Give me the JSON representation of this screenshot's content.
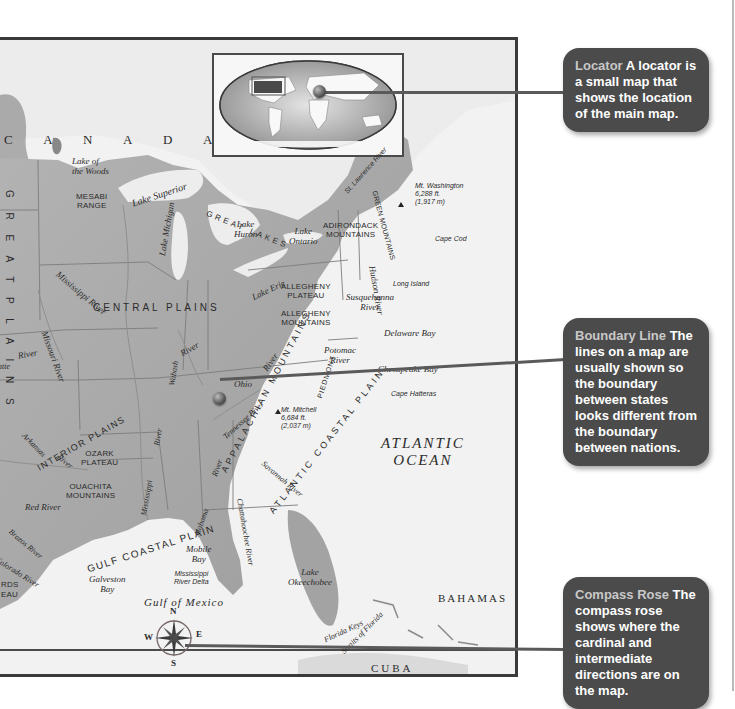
{
  "map": {
    "countries": {
      "canada": "C A N A D A",
      "bahamas": "BAHAMAS",
      "cuba": "CUBA"
    },
    "oceans": {
      "atlantic_line1": "ATLANTIC",
      "atlantic_line2": "OCEAN",
      "gulf": "Gulf of Mexico"
    },
    "regions": {
      "great_lakes": "GREAT LAKES",
      "great_plains_vertical": "G R E A T   P L A I N S",
      "central_plains": "CENTRAL PLAINS",
      "interior_plains": "INTERIOR PLAINS",
      "gulf_coastal_plain": "GULF COASTAL PLAIN",
      "atlantic_coastal_plain": "ATLANTIC COASTAL PLAIN",
      "appalachian_mountains": "APPALACHIAN MOUNTAINS",
      "piedmont": "PIEDMONT"
    },
    "landforms": {
      "mesabi": [
        "MESABI",
        "RANGE"
      ],
      "adirondack": [
        "ADIRONDACK",
        "MOUNTAINS"
      ],
      "green_mountains": "GREEN MOUNTAINS",
      "allegheny_plateau": [
        "ALLEGHENY",
        "PLATEAU"
      ],
      "allegheny_mountains": [
        "ALLEGHENY",
        "MOUNTAINS"
      ],
      "ozark": [
        "OZARK",
        "PLATEAU"
      ],
      "ouachita": [
        "OUACHITA",
        "MOUNTAINS"
      ],
      "edwards_plateau_partial": [
        "RDS",
        "EAU"
      ]
    },
    "lakes": {
      "lake_of_the_woods": [
        "Lake of",
        "the Woods"
      ],
      "superior": "Lake Superior",
      "michigan": "Lake Michigan",
      "huron": [
        "Lake",
        "Huron"
      ],
      "erie": "Lake Erie",
      "ontario": [
        "Lake",
        "Ontario"
      ],
      "okeechobee": [
        "Lake",
        "Okeechobee"
      ]
    },
    "rivers": {
      "mississippi_upper": "Mississippi River",
      "mississippi_lower": "Mississippi",
      "missouri": "Missouri River",
      "st_lawrence": "St. Lawrence River",
      "hudson": "Hudson River",
      "susquehanna": [
        "Susquehanna",
        "River"
      ],
      "potomac": [
        "Potomac",
        "River"
      ],
      "ohio": "Ohio",
      "ohio_river": "River",
      "wabash": "Wabash",
      "wabash_river": "River",
      "tennessee": "Tennessee River",
      "arkansas": "Arkansas",
      "arkansas_river": "River",
      "red": "Red River",
      "brazos": "Brazos River",
      "colorado": "Colorado River",
      "alabama": "Alabama",
      "alabama_river": "River",
      "chattahoochee": "Chattahoochee River",
      "savannah": "Savannah River",
      "platte_partial": "atte",
      "platte_river": "River",
      "mississippi_lower_river": "River"
    },
    "coastal": {
      "cape_cod": "Cape Cod",
      "long_island": "Long Island",
      "delaware_bay": "Delaware Bay",
      "chesapeake_bay": "Chesapeake Bay",
      "cape_hatteras": "Cape Hatteras",
      "mobile_bay": [
        "Mobile",
        "Bay"
      ],
      "galveston_bay": [
        "Galveston",
        "Bay"
      ],
      "miss_delta": [
        "Mississippi",
        "River Delta"
      ],
      "florida_keys": "Florida Keys",
      "straits_of_florida": "Straits of Florida"
    },
    "peaks": {
      "washington": [
        "Mt. Washington",
        "6,288 ft.",
        "(1,917 m)"
      ],
      "mitchell": [
        "Mt. Mitchell",
        "6,684 ft.",
        "(2,037 m)"
      ]
    },
    "compass": {
      "n": "N",
      "s": "S",
      "e": "E",
      "w": "W"
    }
  },
  "callouts": [
    {
      "term": "Locator",
      "text": " A locator is a small map that shows the location of the main map."
    },
    {
      "term": "Boundary Line",
      "text": " The lines on a map are usually shown so the boundary between states looks different from the boundary between nations."
    },
    {
      "term": "Compass Rose",
      "text": " The compass rose shows where the cardinal and intermediate directions are on the map."
    }
  ],
  "colors": {
    "callout_bg": "#4b4b4b",
    "callout_term": "#c8c8c8",
    "land": "#a9a9a9",
    "water": "#f2f2f2",
    "frame": "#3a3a3a"
  }
}
